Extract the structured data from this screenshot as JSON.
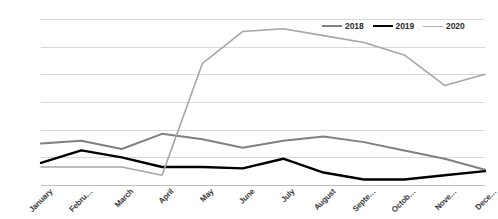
{
  "chart_data": {
    "type": "line",
    "title": "",
    "xlabel": "",
    "ylabel": "",
    "grid": true,
    "legend_position": "top-right",
    "ylim": [
      0,
      60
    ],
    "ytick_values": [
      0,
      10,
      20,
      30,
      40,
      50,
      60
    ],
    "ytick_labels": [
      "0%",
      "10%",
      "20%",
      "30%",
      "40%",
      "50%",
      "60%"
    ],
    "categories": [
      "January",
      "Febru…",
      "March",
      "April",
      "May",
      "June",
      "July",
      "August",
      "Septe…",
      "Octob…",
      "Nove…",
      "Dece…"
    ],
    "series": [
      {
        "name": "2018",
        "color": "#808080",
        "width": 2.0,
        "values": [
          15.0,
          16.0,
          13.0,
          18.5,
          16.5,
          13.5,
          16.0,
          17.5,
          15.5,
          12.5,
          9.5,
          5.5
        ]
      },
      {
        "name": "2019",
        "color": "#000000",
        "width": 2.4,
        "values": [
          8.0,
          12.5,
          10.0,
          6.5,
          6.5,
          6.0,
          9.5,
          4.5,
          2.0,
          2.0,
          3.5,
          5.0
        ]
      },
      {
        "name": "2020",
        "color": "#a6a6a6",
        "width": 1.6,
        "values": [
          6.5,
          6.5,
          6.5,
          3.5,
          44.0,
          55.5,
          56.5,
          54.0,
          51.5,
          47.0,
          36.0,
          40.0
        ]
      }
    ],
    "note_series_mapping": {
      "2018_tail": [
        16.0,
        17.5,
        15.5,
        12.5,
        9.5,
        5.5
      ],
      "2019_tail": [
        2.0,
        2.0,
        8.0,
        21.0,
        14.5
      ],
      "2020_tail": [
        51.5,
        47.0,
        36.0,
        40.0,
        37.5
      ]
    }
  },
  "legend": {
    "items": [
      {
        "label": "2018",
        "color": "#808080",
        "width": 2.0
      },
      {
        "label": "2019",
        "color": "#000000",
        "width": 2.6
      },
      {
        "label": "2020",
        "color": "#b0b0b0",
        "width": 1.6
      }
    ]
  }
}
